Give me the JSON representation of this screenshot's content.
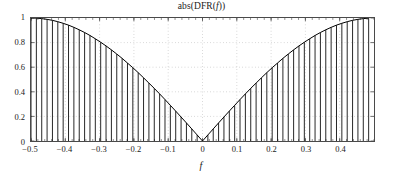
{
  "chart_data": {
    "type": "line",
    "title": "abs(DFR(f))",
    "title_parts": {
      "prefix": "abs(DFR(",
      "var": "f",
      "suffix": "))"
    },
    "xlabel": "f",
    "ylabel": "",
    "xlim": [
      -0.5,
      0.5
    ],
    "ylim": [
      0,
      1
    ],
    "grid": true,
    "legend": null,
    "xticks": [
      -0.5,
      -0.4,
      -0.3,
      -0.2,
      -0.1,
      0,
      0.1,
      0.2,
      0.3,
      0.4
    ],
    "xtick_labels": [
      "−0.5",
      "−0.4",
      "−0.3",
      "−0.2",
      "−0.1",
      "0",
      "0.1",
      "0.2",
      "0.3",
      "0.4"
    ],
    "yticks": [
      0,
      0.2,
      0.4,
      0.6,
      0.8,
      1
    ],
    "ytick_labels": [
      "0",
      "0.2",
      "0.4",
      "0.6",
      "0.8",
      "1"
    ],
    "series_name": "abs(DFR(f))",
    "marker_style": "stem",
    "line_color": "#000000",
    "stem_color": "#000000",
    "x": [
      -0.5,
      -0.484375,
      -0.46875,
      -0.453125,
      -0.4375,
      -0.421875,
      -0.40625,
      -0.390625,
      -0.375,
      -0.359375,
      -0.34375,
      -0.328125,
      -0.3125,
      -0.296875,
      -0.28125,
      -0.265625,
      -0.25,
      -0.234375,
      -0.21875,
      -0.203125,
      -0.1875,
      -0.171875,
      -0.15625,
      -0.140625,
      -0.125,
      -0.109375,
      -0.09375,
      -0.078125,
      -0.0625,
      -0.046875,
      -0.03125,
      -0.015625,
      0,
      0.015625,
      0.03125,
      0.046875,
      0.0625,
      0.078125,
      0.09375,
      0.109375,
      0.125,
      0.140625,
      0.15625,
      0.171875,
      0.1875,
      0.203125,
      0.21875,
      0.234375,
      0.25,
      0.265625,
      0.28125,
      0.296875,
      0.3125,
      0.328125,
      0.34375,
      0.359375,
      0.375,
      0.390625,
      0.40625,
      0.421875,
      0.4375,
      0.453125,
      0.46875,
      0.484375
    ],
    "values": [
      1.0,
      0.999,
      0.995,
      0.989,
      0.981,
      0.97,
      0.957,
      0.942,
      0.924,
      0.904,
      0.882,
      0.858,
      0.831,
      0.803,
      0.773,
      0.741,
      0.707,
      0.672,
      0.634,
      0.596,
      0.556,
      0.514,
      0.471,
      0.428,
      0.383,
      0.337,
      0.29,
      0.243,
      0.195,
      0.147,
      0.098,
      0.049,
      0.0,
      0.049,
      0.098,
      0.147,
      0.195,
      0.243,
      0.29,
      0.337,
      0.383,
      0.428,
      0.471,
      0.514,
      0.556,
      0.596,
      0.634,
      0.672,
      0.707,
      0.741,
      0.773,
      0.803,
      0.831,
      0.858,
      0.882,
      0.904,
      0.924,
      0.942,
      0.957,
      0.97,
      0.981,
      0.989,
      0.995,
      0.999
    ]
  },
  "figure": {
    "background_color": "#ffffff",
    "axis_color": "#4a4a4a",
    "grid_color": "#bcbcbc",
    "text_color": "#1a1a1a"
  }
}
